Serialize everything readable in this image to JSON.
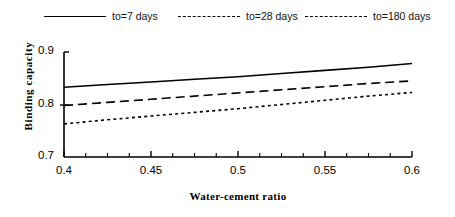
{
  "legend": {
    "position": "top",
    "items": [
      {
        "label": "to=7 days",
        "style": "solid"
      },
      {
        "label": "to=28 days",
        "style": "dashed"
      },
      {
        "label": "to=180 days",
        "style": "dotted"
      }
    ]
  },
  "axes": {
    "xlabel": "Water-cement ratio",
    "ylabel": "Binding  capacity",
    "xticks": [
      "0.4",
      "0.45",
      "0.5",
      "0.55",
      "0.6"
    ],
    "yticks": [
      "0.9",
      "0.8",
      "0.7"
    ]
  },
  "chart_data": {
    "type": "line",
    "title": "",
    "xlabel": "Water-cement ratio",
    "ylabel": "Binding capacity",
    "xlim": [
      0.4,
      0.6
    ],
    "ylim": [
      0.7,
      0.9
    ],
    "xticks": [
      0.4,
      0.45,
      0.5,
      0.55,
      0.6
    ],
    "yticks": [
      0.7,
      0.8,
      0.9
    ],
    "minor_xtick_step": 0.0125,
    "grid": false,
    "legend_position": "top",
    "x": [
      0.4,
      0.425,
      0.45,
      0.475,
      0.5,
      0.525,
      0.55,
      0.575,
      0.6
    ],
    "series": [
      {
        "name": "to=7 days",
        "style": "solid",
        "color": "#000000",
        "values": [
          0.833,
          0.838,
          0.843,
          0.848,
          0.853,
          0.859,
          0.865,
          0.871,
          0.878
        ]
      },
      {
        "name": "to=28 days",
        "style": "dashed",
        "color": "#000000",
        "values": [
          0.798,
          0.804,
          0.81,
          0.816,
          0.822,
          0.828,
          0.834,
          0.84,
          0.845
        ]
      },
      {
        "name": "to=180 days",
        "style": "dotted",
        "color": "#000000",
        "values": [
          0.763,
          0.771,
          0.778,
          0.785,
          0.792,
          0.8,
          0.808,
          0.816,
          0.823
        ]
      }
    ]
  }
}
